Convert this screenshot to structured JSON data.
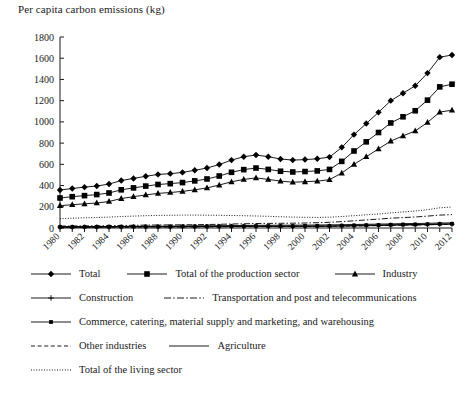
{
  "chart_data": {
    "type": "line",
    "title": "Per capita carbon emissions (kg)",
    "xlabel": "",
    "ylabel": "Per capita carbon emissions (kg)",
    "ylim": [
      0,
      1800
    ],
    "yticks": [
      0,
      200,
      400,
      600,
      800,
      1000,
      1200,
      1400,
      1600,
      1800
    ],
    "grid": false,
    "legend_position": "bottom",
    "x": [
      1980,
      1981,
      1982,
      1983,
      1984,
      1985,
      1986,
      1987,
      1988,
      1989,
      1990,
      1991,
      1992,
      1993,
      1994,
      1995,
      1996,
      1997,
      1998,
      1999,
      2000,
      2001,
      2002,
      2003,
      2004,
      2005,
      2006,
      2007,
      2008,
      2009,
      2010,
      2011,
      2012
    ],
    "xtick_labels": [
      "1980",
      "1982",
      "1984",
      "1986",
      "1988",
      "1990",
      "1992",
      "1994",
      "1996",
      "1998",
      "2000",
      "2002",
      "2004",
      "2006",
      "2008",
      "2010",
      "2012"
    ],
    "series": [
      {
        "name": "Total",
        "marker": "diamond",
        "values": [
          358,
          372,
          385,
          396,
          414,
          448,
          467,
          487,
          505,
          512,
          524,
          544,
          565,
          598,
          640,
          672,
          688,
          672,
          650,
          640,
          645,
          652,
          668,
          760,
          880,
          985,
          1090,
          1200,
          1270,
          1340,
          1460,
          1610,
          1630
        ]
      },
      {
        "name": "Total of the production sector",
        "marker": "square",
        "values": [
          283,
          295,
          305,
          315,
          330,
          360,
          378,
          395,
          410,
          418,
          428,
          444,
          462,
          490,
          525,
          550,
          565,
          552,
          535,
          528,
          532,
          538,
          552,
          628,
          726,
          812,
          900,
          990,
          1048,
          1105,
          1205,
          1330,
          1355
        ]
      },
      {
        "name": "Industry",
        "marker": "triangle",
        "values": [
          210,
          220,
          228,
          236,
          250,
          278,
          295,
          312,
          326,
          335,
          345,
          360,
          378,
          405,
          435,
          458,
          472,
          458,
          442,
          432,
          436,
          442,
          455,
          518,
          600,
          672,
          745,
          820,
          868,
          915,
          995,
          1092,
          1110
        ]
      },
      {
        "name": "Construction",
        "marker": "plus",
        "values": [
          8,
          8,
          8,
          9,
          9,
          10,
          10,
          11,
          11,
          11,
          12,
          12,
          13,
          13,
          14,
          15,
          15,
          15,
          15,
          15,
          15,
          16,
          16,
          18,
          20,
          22,
          24,
          26,
          28,
          29,
          32,
          35,
          36
        ]
      },
      {
        "name": "Transportation and post and telecommunications",
        "marker": "dashdot",
        "values": [
          18,
          19,
          20,
          21,
          22,
          24,
          25,
          27,
          28,
          29,
          30,
          31,
          33,
          35,
          38,
          40,
          42,
          43,
          44,
          45,
          47,
          50,
          54,
          60,
          68,
          76,
          84,
          92,
          98,
          104,
          112,
          122,
          126
        ]
      },
      {
        "name": "Commerce, catering, material supply and marketing, and warehousing",
        "marker": "small-square",
        "values": [
          10,
          10,
          11,
          11,
          12,
          12,
          13,
          13,
          14,
          14,
          15,
          15,
          16,
          16,
          17,
          17,
          18,
          18,
          18,
          18,
          19,
          19,
          20,
          22,
          24,
          26,
          28,
          30,
          32,
          33,
          35,
          38,
          39
        ]
      },
      {
        "name": "Other industries",
        "marker": "dashed",
        "values": [
          6,
          6,
          7,
          7,
          7,
          8,
          8,
          9,
          9,
          9,
          10,
          10,
          11,
          11,
          12,
          12,
          13,
          13,
          13,
          14,
          14,
          15,
          16,
          17,
          19,
          21,
          23,
          25,
          27,
          28,
          30,
          33,
          34
        ]
      },
      {
        "name": "Agriculture",
        "marker": "solid",
        "values": [
          12,
          13,
          13,
          14,
          14,
          15,
          16,
          17,
          17,
          18,
          19,
          20,
          21,
          22,
          23,
          24,
          25,
          25,
          26,
          26,
          27,
          28,
          29,
          31,
          33,
          35,
          37,
          39,
          41,
          42,
          44,
          47,
          48
        ]
      },
      {
        "name": "Total of the living sector",
        "marker": "dotted",
        "values": [
          88,
          92,
          96,
          99,
          103,
          108,
          112,
          116,
          119,
          120,
          122,
          122,
          121,
          120,
          118,
          116,
          113,
          110,
          106,
          103,
          101,
          100,
          102,
          108,
          116,
          124,
          132,
          142,
          152,
          160,
          172,
          190,
          198
        ]
      }
    ]
  },
  "legend": {
    "rows": [
      [
        {
          "label": "Total",
          "key": "line-diamond"
        },
        {
          "label": "Total of the production sector",
          "key": "line-square"
        },
        {
          "label": "Industry",
          "key": "line-triangle"
        }
      ],
      [
        {
          "label": "Construction",
          "key": "line-plus"
        },
        {
          "label": "Transportation and post and telecommunications",
          "key": "line-dashdot"
        }
      ],
      [
        {
          "label": "Commerce, catering, material supply and marketing, and warehousing",
          "key": "line-small-square"
        }
      ],
      [
        {
          "label": "Other industries",
          "key": "line-dashed"
        },
        {
          "label": "Agriculture",
          "key": "line-solid"
        }
      ],
      [
        {
          "label": "Total of the living sector",
          "key": "line-dotted"
        }
      ]
    ]
  },
  "colors": {
    "line": "#000000",
    "axis": "#1a1a1a",
    "background": "#ffffff"
  }
}
